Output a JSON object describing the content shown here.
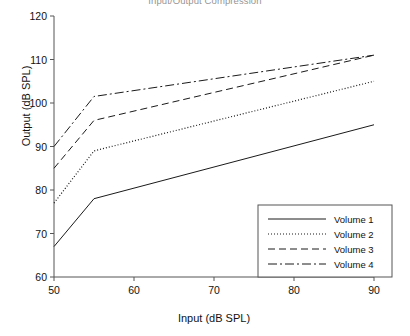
{
  "chart_data": {
    "type": "line",
    "title": "Input/Output Compression",
    "xlabel": "Input (dB SPL)",
    "ylabel": "Output (dB SPL)",
    "xlim": [
      50,
      90
    ],
    "ylim": [
      60,
      120
    ],
    "xticks": [
      "50",
      "60",
      "70",
      "80",
      "90"
    ],
    "yticks": [
      "60",
      "70",
      "80",
      "90",
      "100",
      "110",
      "120"
    ],
    "grid": false,
    "legend_position": "lower right",
    "x": [
      50,
      55,
      90
    ],
    "series": [
      {
        "name": "Volume 1",
        "style": "solid",
        "values": [
          67,
          78,
          95
        ]
      },
      {
        "name": "Volume 2",
        "style": "dotted",
        "values": [
          77,
          89,
          105
        ]
      },
      {
        "name": "Volume 3",
        "style": "dashed",
        "values": [
          85,
          96,
          111
        ]
      },
      {
        "name": "Volume 4",
        "style": "dashdot",
        "values": [
          90,
          101.5,
          111
        ]
      }
    ]
  },
  "legend": {
    "items": [
      {
        "label": "Volume 1"
      },
      {
        "label": "Volume 2"
      },
      {
        "label": "Volume 3"
      },
      {
        "label": "Volume 4"
      }
    ]
  },
  "axis": {
    "x_tick_labels": [
      "50",
      "60",
      "70",
      "80",
      "90"
    ],
    "y_tick_labels": [
      "60",
      "70",
      "80",
      "90",
      "100",
      "110",
      "120"
    ]
  },
  "colors": {
    "line": "#1a1a1a",
    "axis": "#555555",
    "background": "#ffffff"
  }
}
